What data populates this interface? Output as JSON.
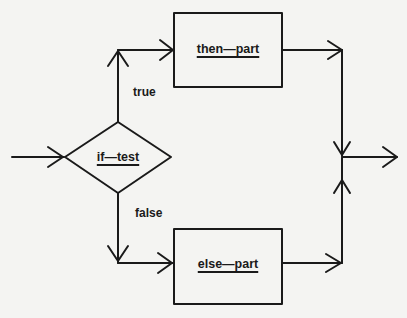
{
  "diagram": {
    "type": "flowchart",
    "title": "",
    "colors": {
      "line": "#1a1a1a",
      "background": "#f4f4f2"
    },
    "nodes": {
      "decision": {
        "id": "if-test",
        "shape": "diamond",
        "label": "if—test"
      },
      "then": {
        "id": "then-part",
        "shape": "rectangle",
        "label": "then—part"
      },
      "else": {
        "id": "else-part",
        "shape": "rectangle",
        "label": "else—part"
      }
    },
    "edge_labels": {
      "true": "true",
      "false": "false"
    },
    "edges": [
      {
        "from": "entry",
        "to": "if-test",
        "label": ""
      },
      {
        "from": "if-test",
        "to": "then-part",
        "label": "true"
      },
      {
        "from": "if-test",
        "to": "else-part",
        "label": "false"
      },
      {
        "from": "then-part",
        "to": "merge",
        "label": ""
      },
      {
        "from": "else-part",
        "to": "merge",
        "label": ""
      },
      {
        "from": "merge",
        "to": "exit",
        "label": ""
      }
    ]
  }
}
